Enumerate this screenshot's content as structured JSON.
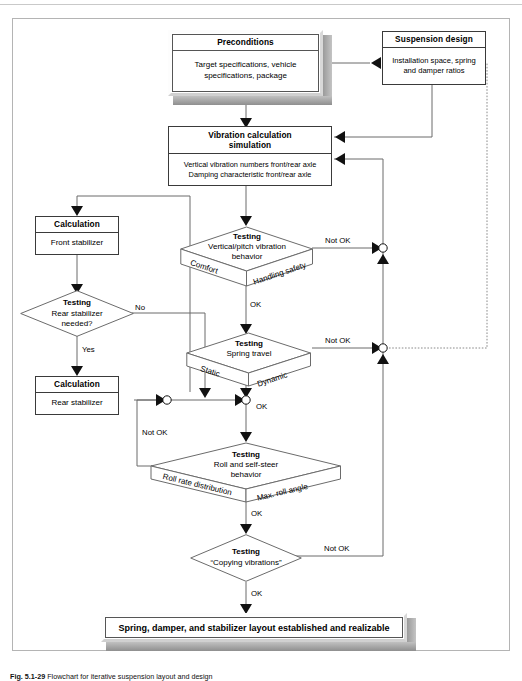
{
  "figure": {
    "caption_number": "Fig. 5.1-29",
    "caption_text": "Flowchart for iterative suspension layout and design"
  },
  "nodes": {
    "preconditions": {
      "title": "Preconditions",
      "body": "Target specifications, vehicle\nspecifications, package"
    },
    "suspension_design": {
      "title": "Suspension design",
      "body": "Installation space, spring\nand damper ratios"
    },
    "vibration_calc": {
      "title": "Vibration calculation\nsimulation",
      "body": "Vertical vibration numbers front/rear axle\nDamping characteristic front/rear axle"
    },
    "calc_front": {
      "title": "Calculation",
      "body": "Front stabilizer"
    },
    "calc_rear": {
      "title": "Calculation",
      "body": "Rear stabilizer"
    },
    "test_rear_stab": {
      "title": "Testing",
      "body": "Rear stabilizer\nneeded?"
    },
    "test_vertical": {
      "title": "Testing",
      "body": "Vertical/pitch vibration\nbehavior",
      "face_left": "Comfort",
      "face_right": "Handling safety"
    },
    "test_spring_travel": {
      "title": "Testing",
      "body": "Spring travel",
      "face_left": "Static",
      "face_right": "Dynamic"
    },
    "test_roll": {
      "title": "Testing",
      "body": "Roll and self-steer\nbehavior",
      "face_left": "Roll rate distribution",
      "face_right": "Max. roll angle"
    },
    "test_copying": {
      "title": "Testing",
      "body": "“Copying vibrations”"
    },
    "result": {
      "body": "Spring, damper, and stabilizer layout established and realizable"
    }
  },
  "edge_labels": {
    "not_ok_vertical": "Not OK",
    "ok_vertical": "OK",
    "not_ok_spring": "Not OK",
    "ok_spring": "OK",
    "not_ok_roll": "Not OK",
    "ok_roll": "OK",
    "not_ok_copying": "Not OK",
    "ok_copying": "OK",
    "rear_stab_no": "No",
    "rear_stab_yes": "Yes"
  },
  "colors": {
    "line": "#555555",
    "box_border": "#3a3a3a",
    "extrude": "#a0a0a0",
    "frame": "#b4b4b4",
    "text": "#000000"
  }
}
